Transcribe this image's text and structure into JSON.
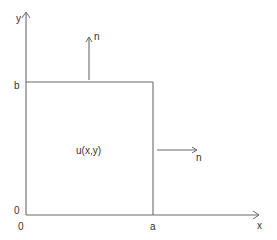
{
  "diagram": {
    "type": "rectangular-domain",
    "colors": {
      "line": "#6a6a6a",
      "text": "#333333",
      "background": "#ffffff"
    },
    "axes": {
      "x_label": "x",
      "y_label": "y",
      "origin_x_label": "0",
      "origin_y_label": "0"
    },
    "domain": {
      "function_label": "u(x,y)",
      "width_label": "a",
      "height_label": "b"
    },
    "normals": [
      {
        "edge": "top",
        "direction": "up",
        "label": "n"
      },
      {
        "edge": "right",
        "direction": "right",
        "label": "n"
      }
    ]
  }
}
